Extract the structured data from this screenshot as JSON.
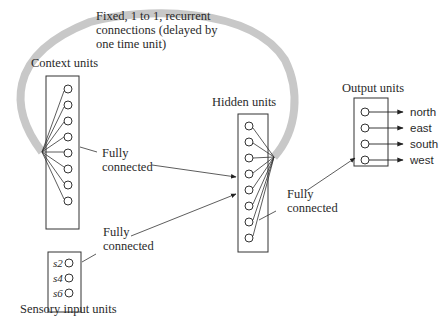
{
  "diagram": {
    "title_note": {
      "line1": "Fixed, 1 to 1, recurrent",
      "line2": "connections (delayed by",
      "line3": "one time unit)"
    },
    "layers": {
      "context": {
        "label": "Context units",
        "unit_count": 8
      },
      "sensory": {
        "label": "Sensory input units",
        "units": [
          "s2",
          "s4",
          "s6",
          "s8"
        ]
      },
      "hidden": {
        "label": "Hidden units",
        "unit_count": 8
      },
      "output": {
        "label": "Output units",
        "units": [
          "north",
          "east",
          "south",
          "west"
        ]
      }
    },
    "connection_labels": {
      "context_to_hidden": {
        "line1": "Fully",
        "line2": "connected"
      },
      "sensory_to_hidden": {
        "line1": "Fully",
        "line2": "connected"
      },
      "hidden_to_output": {
        "line1": "Fully",
        "line2": "connected"
      }
    },
    "colors": {
      "recurrent_arc": "#c8c8c8",
      "lines": "#333333",
      "text": "#2a2a2a"
    }
  }
}
